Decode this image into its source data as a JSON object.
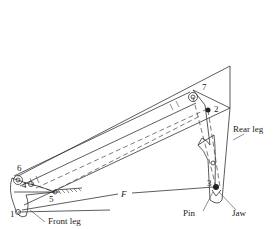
{
  "diagram": {
    "type": "mechanism",
    "labels": {
      "pin1": "1",
      "pin2": "2",
      "pin3": "3",
      "pin4": "4",
      "pin5": "5",
      "pin6": "6",
      "pin7": "7",
      "force": "F",
      "front_leg": "Front leg",
      "rear_leg": "Rear leg",
      "pin": "Pin",
      "jaw": "Jaw"
    }
  }
}
